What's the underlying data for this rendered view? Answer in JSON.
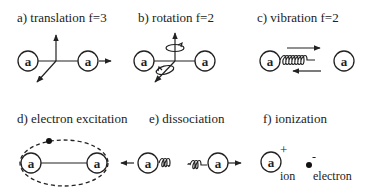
{
  "panels": {
    "a": {
      "label": "a) translation  f=3",
      "atom": "a"
    },
    "b": {
      "label": "b) rotation  f=2",
      "atom": "a"
    },
    "c": {
      "label": "c) vibration  f=2",
      "atom": "a"
    },
    "d": {
      "label": "d) electron excitation",
      "atom": "a"
    },
    "e": {
      "label": "e) dissociation",
      "atom": "a"
    },
    "f": {
      "label": "f) ionization",
      "atom": "a",
      "ion_charge": "+",
      "ion_label": "ion",
      "electron_charge": "-",
      "electron_label": "electron"
    }
  },
  "colors": {
    "ink": "#222222",
    "background": "#ffffff"
  }
}
